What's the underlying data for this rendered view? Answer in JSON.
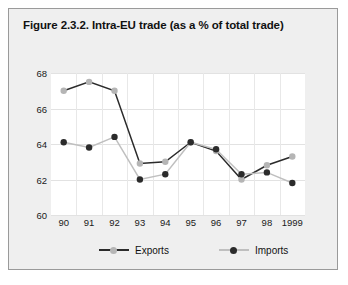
{
  "figure": {
    "title": "Figure 2.3.2. Intra-EU trade (as a % of total trade)",
    "border_color": "#9a9a9a",
    "panel_color": "#efefef",
    "plot_bg": "#ffffff"
  },
  "legend": {
    "position": "bottom",
    "entries": [
      {
        "label": "Exports",
        "marker_color": "#b5b5b5",
        "line_color": "#2b2b2b"
      },
      {
        "label": "Imports",
        "marker_color": "#2b2b2b",
        "line_color": "#bfbfbf"
      }
    ]
  },
  "axes": {
    "y_ticks": [
      "68",
      "66",
      "64",
      "62",
      "60"
    ],
    "x_ticks": [
      "90",
      "91",
      "92",
      "93",
      "94",
      "95",
      "96",
      "97",
      "98",
      "1999"
    ]
  },
  "chart_data": {
    "type": "line",
    "title": "Figure 2.3.2. Intra-EU trade (as a % of total trade)",
    "xlabel": "",
    "ylabel": "",
    "x": [
      "90",
      "91",
      "92",
      "93",
      "94",
      "95",
      "96",
      "97",
      "98",
      "1999"
    ],
    "categories": [
      "90",
      "91",
      "92",
      "93",
      "94",
      "95",
      "96",
      "97",
      "98",
      "1999"
    ],
    "ylim": [
      60,
      68
    ],
    "yticks": [
      60,
      62,
      64,
      66,
      68
    ],
    "grid": true,
    "legend_position": "bottom",
    "series": [
      {
        "name": "Exports",
        "marker_color": "#b5b5b5",
        "line_color": "#2b2b2b",
        "values": [
          67.0,
          67.5,
          67.0,
          62.9,
          63.0,
          64.1,
          63.6,
          62.0,
          62.8,
          63.3
        ]
      },
      {
        "name": "Imports",
        "marker_color": "#2b2b2b",
        "line_color": "#bfbfbf",
        "values": [
          64.1,
          63.8,
          64.4,
          62.0,
          62.3,
          64.1,
          63.7,
          62.3,
          62.4,
          61.8
        ]
      }
    ]
  }
}
